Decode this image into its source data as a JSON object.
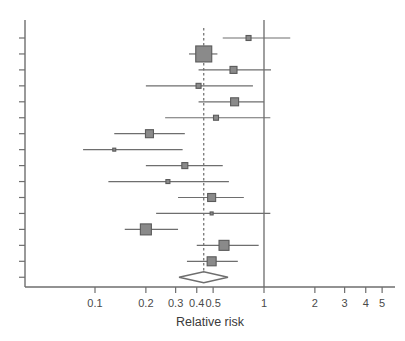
{
  "chart_data": {
    "type": "forest",
    "title": "",
    "xlabel": "Relative risk",
    "ylabel": "",
    "xscale": "log",
    "xlim": [
      0.085,
      5.6
    ],
    "xticks": [
      0.1,
      0.2,
      0.3,
      0.4,
      0.5,
      1,
      2,
      3,
      4,
      5
    ],
    "xticklabels": [
      "0.1",
      "0.2",
      "0.3",
      "0.4",
      "0.5",
      "1",
      "2",
      "3",
      "4",
      "5"
    ],
    "grid": false,
    "legend": null,
    "reference_line": {
      "value": 1,
      "style": "solid",
      "color": "#6b6b6b"
    },
    "summary_line": {
      "value": 0.44,
      "style": "dashed",
      "color": "#6b6b6b"
    },
    "marker_color": "#8a8a8a",
    "marker_edge_color": "#5a5a5a",
    "line_color": "#6e6e6e",
    "studies": [
      {
        "row": 1,
        "rr": 0.81,
        "ci_low": 0.57,
        "ci_high": 1.43,
        "weight": 5
      },
      {
        "row": 2,
        "rr": 0.44,
        "ci_low": 0.36,
        "ci_high": 0.53,
        "weight": 16
      },
      {
        "row": 3,
        "rr": 0.66,
        "ci_low": 0.41,
        "ci_high": 1.1,
        "weight": 7
      },
      {
        "row": 4,
        "rr": 0.41,
        "ci_low": 0.2,
        "ci_high": 0.86,
        "weight": 5
      },
      {
        "row": 5,
        "rr": 0.67,
        "ci_low": 0.41,
        "ci_high": 1.0,
        "weight": 8
      },
      {
        "row": 6,
        "rr": 0.52,
        "ci_low": 0.26,
        "ci_high": 1.09,
        "weight": 5
      },
      {
        "row": 7,
        "rr": 0.21,
        "ci_low": 0.13,
        "ci_high": 0.34,
        "weight": 8
      },
      {
        "row": 8,
        "rr": 0.13,
        "ci_low": 0.085,
        "ci_high": 0.33,
        "weight": 3
      },
      {
        "row": 9,
        "rr": 0.34,
        "ci_low": 0.2,
        "ci_high": 0.57,
        "weight": 6
      },
      {
        "row": 10,
        "rr": 0.27,
        "ci_low": 0.12,
        "ci_high": 0.62,
        "weight": 4
      },
      {
        "row": 11,
        "rr": 0.49,
        "ci_low": 0.31,
        "ci_high": 0.76,
        "weight": 8
      },
      {
        "row": 12,
        "rr": 0.49,
        "ci_low": 0.23,
        "ci_high": 1.09,
        "weight": 3
      },
      {
        "row": 13,
        "rr": 0.2,
        "ci_low": 0.15,
        "ci_high": 0.31,
        "weight": 11
      },
      {
        "row": 14,
        "rr": 0.58,
        "ci_low": 0.4,
        "ci_high": 0.93,
        "weight": 10
      },
      {
        "row": 15,
        "rr": 0.49,
        "ci_low": 0.35,
        "ci_high": 0.7,
        "weight": 9
      }
    ],
    "summary": {
      "row": 16,
      "rr": 0.44,
      "ci_low": 0.37,
      "ci_high": 0.52,
      "shape": "diamond",
      "filled": false
    }
  },
  "axis": {
    "x_title": "Relative risk"
  }
}
